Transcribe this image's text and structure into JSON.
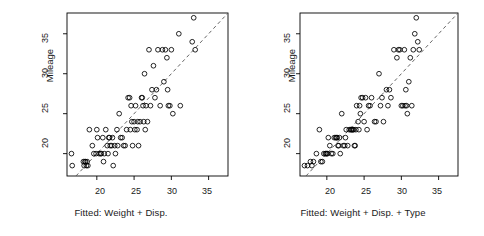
{
  "figure": {
    "background": "#ffffff",
    "point_color": "#000000",
    "line_color": "#555555",
    "axis_color": "#000000"
  },
  "chart_data": [
    {
      "type": "scatter",
      "panel_index": 0,
      "title": "",
      "xlabel": "Fitted: Weight + Disp.",
      "ylabel": "Mileage",
      "xlim": [
        16.0,
        37.6
      ],
      "ylim": [
        17.2,
        37.6
      ],
      "xticks": [
        20,
        25,
        30,
        35
      ],
      "yticks": [
        20,
        25,
        30,
        35
      ],
      "xticklabels": [
        "20",
        "25",
        "30",
        "35"
      ],
      "yticklabels": [
        "20",
        "25",
        "30",
        "35"
      ],
      "grid": false,
      "legend": "none",
      "reference_line": {
        "type": "abline",
        "slope": 1,
        "intercept": 0,
        "style": "dashed"
      },
      "marker": "open-circle",
      "x": [
        16.6,
        16.7,
        18.2,
        18.3,
        18.4,
        18.5,
        18.6,
        18.7,
        18.8,
        19.0,
        19.4,
        19.6,
        19.9,
        20.0,
        20.1,
        20.3,
        20.5,
        20.6,
        20.8,
        20.9,
        21.0,
        21.2,
        21.4,
        21.5,
        21.6,
        21.7,
        21.8,
        22.0,
        22.1,
        22.2,
        22.4,
        22.5,
        22.7,
        22.8,
        23.0,
        23.2,
        23.4,
        23.6,
        23.8,
        24.0,
        24.2,
        24.4,
        24.5,
        24.6,
        24.7,
        24.8,
        25.0,
        25.1,
        25.2,
        25.4,
        25.5,
        25.6,
        25.8,
        26.0,
        26.1,
        26.2,
        26.3,
        26.4,
        26.5,
        26.6,
        26.8,
        27.0,
        27.2,
        27.4,
        27.6,
        27.8,
        28.0,
        28.2,
        28.5,
        28.8,
        29.0,
        29.2,
        29.4,
        29.5,
        29.6,
        29.8,
        30.0,
        30.2,
        31.0,
        31.2,
        32.8,
        33.0,
        33.2
      ],
      "y": [
        20.0,
        18.5,
        19.0,
        18.5,
        19.0,
        19.0,
        18.5,
        19.0,
        18.5,
        23.0,
        21.0,
        20.0,
        20.0,
        23.0,
        22.0,
        20.0,
        20.0,
        20.0,
        22.0,
        19.0,
        20.0,
        23.0,
        21.0,
        20.0,
        22.0,
        22.0,
        21.0,
        21.0,
        22.0,
        18.5,
        21.0,
        20.0,
        23.0,
        21.0,
        25.0,
        22.0,
        22.0,
        21.0,
        21.0,
        23.0,
        27.0,
        27.0,
        23.0,
        26.0,
        24.0,
        21.0,
        24.0,
        23.0,
        26.0,
        23.0,
        24.0,
        21.0,
        24.0,
        27.0,
        27.0,
        26.0,
        24.0,
        30.0,
        23.0,
        26.0,
        24.0,
        33.0,
        26.0,
        28.0,
        31.0,
        27.0,
        28.0,
        33.0,
        26.0,
        33.0,
        29.0,
        33.0,
        32.0,
        28.0,
        26.0,
        26.0,
        33.0,
        25.0,
        35.0,
        26.0,
        34.0,
        37.0,
        33.0
      ]
    },
    {
      "type": "scatter",
      "panel_index": 1,
      "title": "",
      "xlabel": "Fitted: Weight + Disp. + Type",
      "ylabel": "Mileage",
      "xlim": [
        16.4,
        37.6
      ],
      "ylim": [
        17.2,
        37.6
      ],
      "xticks": [
        20,
        25,
        30,
        35
      ],
      "yticks": [
        20,
        25,
        30,
        35
      ],
      "xticklabels": [
        "20",
        "25",
        "30",
        "35"
      ],
      "yticklabels": [
        "20",
        "25",
        "30",
        "35"
      ],
      "grid": false,
      "legend": "none",
      "reference_line": {
        "type": "abline",
        "slope": 1,
        "intercept": 0,
        "style": "dashed"
      },
      "marker": "open-circle",
      "x": [
        17.0,
        17.4,
        17.8,
        18.0,
        18.2,
        18.6,
        19.0,
        19.2,
        19.4,
        19.6,
        19.8,
        19.9,
        20.0,
        20.1,
        20.2,
        20.4,
        20.6,
        20.8,
        21.0,
        21.2,
        21.4,
        21.5,
        21.6,
        21.7,
        21.8,
        22.0,
        22.2,
        22.4,
        22.6,
        22.8,
        23.0,
        23.2,
        23.4,
        23.5,
        23.6,
        23.7,
        23.8,
        23.9,
        24.0,
        24.2,
        24.4,
        24.5,
        24.6,
        24.8,
        25.0,
        25.2,
        25.4,
        25.6,
        26.0,
        26.4,
        26.6,
        27.0,
        27.2,
        27.4,
        27.6,
        28.0,
        28.2,
        28.6,
        29.0,
        29.4,
        29.6,
        29.8,
        30.0,
        30.2,
        30.4,
        30.6,
        30.8,
        31.0,
        31.2,
        31.4,
        31.6,
        31.8,
        32.0,
        32.2,
        32.4,
        30.5,
        30.7,
        24.3,
        22.5,
        21.3,
        23.3,
        25.8,
        28.4
      ],
      "y": [
        18.5,
        18.5,
        19.0,
        18.5,
        19.0,
        20.0,
        23.0,
        19.0,
        19.0,
        20.0,
        20.0,
        20.0,
        20.0,
        20.0,
        22.0,
        21.0,
        20.0,
        20.0,
        22.0,
        22.0,
        22.0,
        21.0,
        21.0,
        22.0,
        20.0,
        25.0,
        21.0,
        21.0,
        23.0,
        21.0,
        23.0,
        23.0,
        23.0,
        23.0,
        23.0,
        21.0,
        21.0,
        23.0,
        26.0,
        24.0,
        26.0,
        25.0,
        27.0,
        27.0,
        24.0,
        27.0,
        23.0,
        26.0,
        27.0,
        24.0,
        24.0,
        30.0,
        26.0,
        27.0,
        24.0,
        28.0,
        26.0,
        27.0,
        33.0,
        32.0,
        33.0,
        33.0,
        26.0,
        26.0,
        33.0,
        28.0,
        25.0,
        29.0,
        32.0,
        26.0,
        33.0,
        35.0,
        37.0,
        34.0,
        33.0,
        26.0,
        26.0,
        23.0,
        22.0,
        22.0,
        23.0,
        26.0,
        28.0
      ]
    }
  ],
  "panels": [
    {
      "id": "panel-fitted-weight-disp",
      "xlabel": "Fitted: Weight + Disp.",
      "ylabel": "Mileage",
      "xticklabels": [
        "20",
        "25",
        "30",
        "35"
      ],
      "yticklabels": [
        "20",
        "25",
        "30",
        "35"
      ]
    },
    {
      "id": "panel-fitted-weight-disp-type",
      "xlabel": "Fitted: Weight + Disp. + Type",
      "ylabel": "Mileage",
      "xticklabels": [
        "20",
        "25",
        "30",
        "35"
      ],
      "yticklabels": [
        "20",
        "25",
        "30",
        "35"
      ]
    }
  ]
}
